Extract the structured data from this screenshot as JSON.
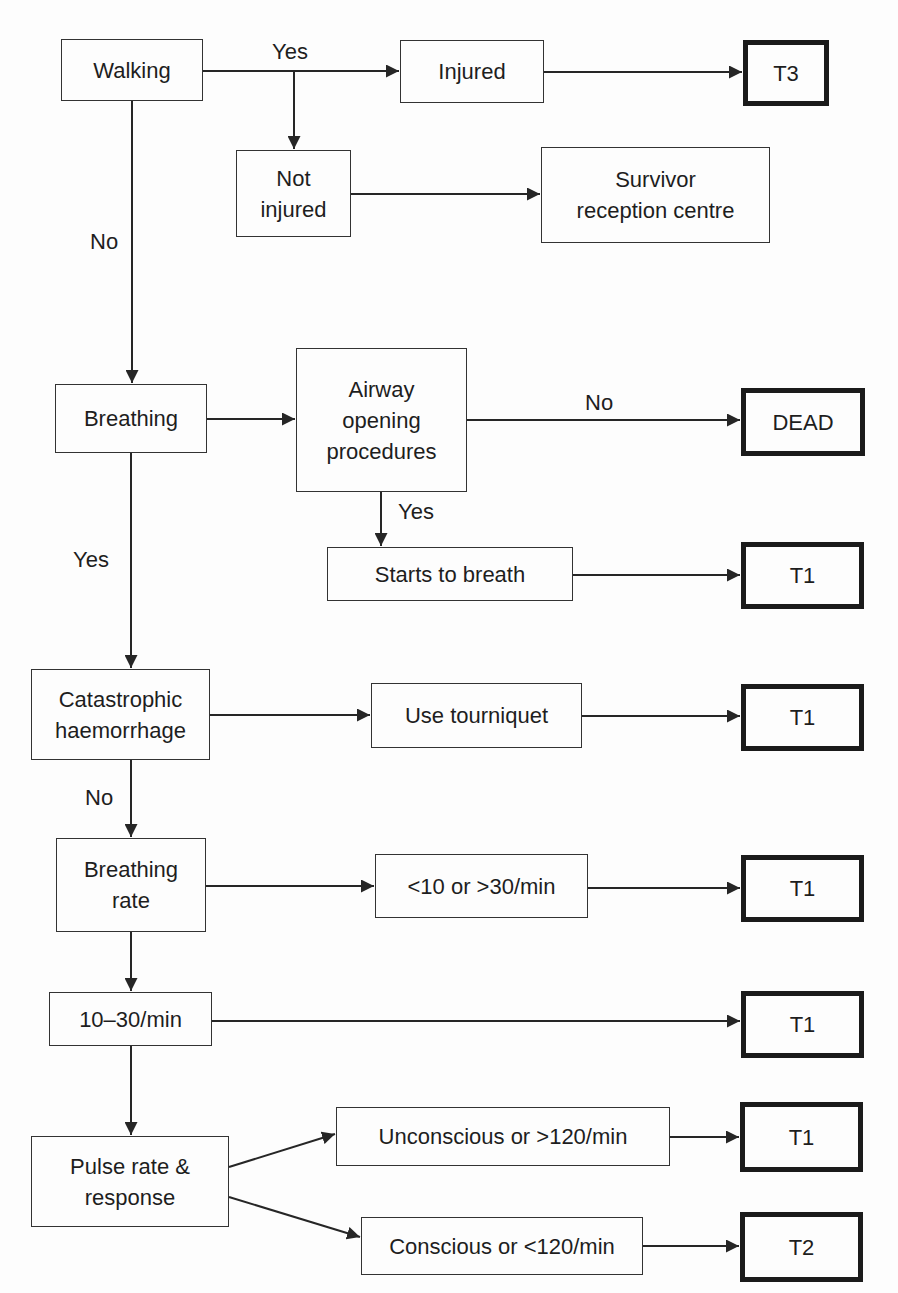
{
  "diagram": {
    "type": "flowchart",
    "nodes": {
      "walking": "Walking",
      "injured": "Injured",
      "t3": "T3",
      "not_injured": "Not\ninjured",
      "survivor": "Survivor\nreception centre",
      "breathing": "Breathing",
      "airway": "Airway\nopening\nprocedures",
      "dead": "DEAD",
      "starts": "Starts to breath",
      "t1_a": "T1",
      "catastrophic": "Catastrophic\nhaemorrhage",
      "tourniquet": "Use tourniquet",
      "t1_b": "T1",
      "breathing_rate": "Breathing\nrate",
      "rate_abnormal": "<10 or >30/min",
      "t1_c": "T1",
      "rate_normal": "10–30/min",
      "t1_d": "T1",
      "pulse": "Pulse rate &\nresponse",
      "unconscious": "Unconscious or >120/min",
      "t1_e": "T1",
      "conscious": "Conscious or <120/min",
      "t2": "T2"
    },
    "edge_labels": {
      "walking_yes": "Yes",
      "walking_no": "No",
      "airway_no": "No",
      "airway_yes": "Yes",
      "breathing_yes": "Yes",
      "catastrophic_no": "No"
    },
    "edges": [
      {
        "from": "walking",
        "to": "injured",
        "label": "Yes"
      },
      {
        "from": "walking",
        "to": "not_injured",
        "label": "Yes"
      },
      {
        "from": "injured",
        "to": "t3"
      },
      {
        "from": "not_injured",
        "to": "survivor"
      },
      {
        "from": "walking",
        "to": "breathing",
        "label": "No"
      },
      {
        "from": "breathing",
        "to": "airway"
      },
      {
        "from": "airway",
        "to": "dead",
        "label": "No"
      },
      {
        "from": "airway",
        "to": "starts",
        "label": "Yes"
      },
      {
        "from": "starts",
        "to": "t1_a"
      },
      {
        "from": "breathing",
        "to": "catastrophic",
        "label": "Yes"
      },
      {
        "from": "catastrophic",
        "to": "tourniquet"
      },
      {
        "from": "tourniquet",
        "to": "t1_b"
      },
      {
        "from": "catastrophic",
        "to": "breathing_rate",
        "label": "No"
      },
      {
        "from": "breathing_rate",
        "to": "rate_abnormal"
      },
      {
        "from": "rate_abnormal",
        "to": "t1_c"
      },
      {
        "from": "breathing_rate",
        "to": "rate_normal"
      },
      {
        "from": "rate_normal",
        "to": "t1_d"
      },
      {
        "from": "rate_normal",
        "to": "pulse"
      },
      {
        "from": "pulse",
        "to": "unconscious"
      },
      {
        "from": "unconscious",
        "to": "t1_e"
      },
      {
        "from": "pulse",
        "to": "conscious"
      },
      {
        "from": "conscious",
        "to": "t2"
      }
    ],
    "colors": {
      "line": "#262626",
      "outcome_border": "#1b1b1b",
      "background": "#fdfdfd"
    }
  }
}
